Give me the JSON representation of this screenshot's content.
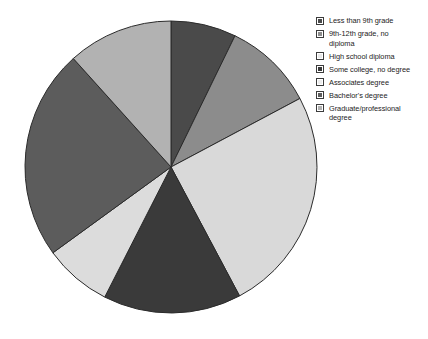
{
  "chart_data": {
    "type": "pie",
    "title": "",
    "subtitle": "",
    "xlabel": "",
    "ylabel": "",
    "grid": false,
    "legend_position": "right",
    "start_angle_deg": 0,
    "direction": "clockwise",
    "center": {
      "x": 171,
      "y": 167
    },
    "radius": 146,
    "categories": [
      "Less than 9th grade",
      "9th-12th grade, no\ndiploma",
      "High school diploma",
      "Some college, no degree",
      "Associates degree",
      "Bachelor's degree",
      "Graduate/professional\ndegree"
    ],
    "values": [
      7.2,
      10.0,
      25.0,
      15.3,
      7.5,
      23.3,
      11.7
    ],
    "start_angles_deg": [
      0,
      26,
      62,
      152,
      207,
      234,
      318
    ],
    "end_angles_deg": [
      26,
      62,
      152,
      207,
      234,
      318,
      360
    ],
    "colors": [
      "#4a4a4a",
      "#8c8c8c",
      "#d9d9d9",
      "#3a3a3a",
      "#dcdcdc",
      "#5c5c5c",
      "#b2b2b2"
    ],
    "slice_edge_color": "#2b2b2b",
    "slice_edge_width": 1,
    "slices": [
      {
        "label": "Less than 9th grade",
        "value": 7.2,
        "color": "#4a4a4a",
        "start_deg": 0,
        "end_deg": 26
      },
      {
        "label": "9th-12th grade, no\ndiploma",
        "value": 10.0,
        "color": "#8c8c8c",
        "start_deg": 26,
        "end_deg": 62
      },
      {
        "label": "High school diploma",
        "value": 25.0,
        "color": "#d9d9d9",
        "start_deg": 62,
        "end_deg": 152
      },
      {
        "label": "Some college, no degree",
        "value": 15.3,
        "color": "#3a3a3a",
        "start_deg": 152,
        "end_deg": 207
      },
      {
        "label": "Associates degree",
        "value": 7.5,
        "color": "#dcdcdc",
        "start_deg": 207,
        "end_deg": 234
      },
      {
        "label": "Bachelor's degree",
        "value": 23.3,
        "color": "#5c5c5c",
        "start_deg": 234,
        "end_deg": 318
      },
      {
        "label": "Graduate/professional\ndegree",
        "value": 11.7,
        "color": "#b2b2b2",
        "start_deg": 318,
        "end_deg": 360
      }
    ]
  },
  "legend": {
    "items": [
      {
        "label": "Less than 9th grade",
        "color": "#4a4a4a"
      },
      {
        "label": "9th-12th grade, no\ndiploma",
        "color": "#8c8c8c"
      },
      {
        "label": "High school diploma",
        "color": "#e8e8e8"
      },
      {
        "label": "Some college, no degree",
        "color": "#3a3a3a"
      },
      {
        "label": "Associates degree",
        "color": "#ececec"
      },
      {
        "label": "Bachelor's degree",
        "color": "#5c5c5c"
      },
      {
        "label": "Graduate/professional\ndegree",
        "color": "#b2b2b2"
      }
    ]
  }
}
